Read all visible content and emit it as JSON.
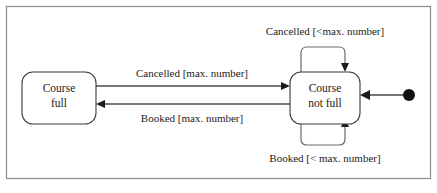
{
  "diagram": {
    "type": "uml-state-machine",
    "frame": {
      "visible": true,
      "color": "#8d8d8d"
    },
    "background": "#ffffff",
    "states": [
      {
        "id": "course-full",
        "label_line1": "Course",
        "label_line2": "full",
        "shape": "rounded-rect"
      },
      {
        "id": "course-not-full",
        "label_line1": "Course",
        "label_line2": "not full",
        "shape": "rounded-rect"
      }
    ],
    "initial_state": {
      "name": "initial-pseudostate",
      "target": "course-not-full",
      "color": "#111111"
    },
    "transitions": [
      {
        "id": "full-to-notfull",
        "from": "course-full",
        "to": "course-not-full",
        "label": "Cancelled [max. number]",
        "position": "upper-middle"
      },
      {
        "id": "notfull-to-full",
        "from": "course-not-full",
        "to": "course-full",
        "label": "Booked [max. number]",
        "position": "lower-middle"
      },
      {
        "id": "notfull-self-cancelled",
        "from": "course-not-full",
        "to": "course-not-full",
        "label": "Cancelled [<max. number]",
        "position": "top-self-loop"
      },
      {
        "id": "notfull-self-booked",
        "from": "course-not-full",
        "to": "course-not-full",
        "label": "Booked [< max. number]",
        "position": "bottom-self-loop"
      }
    ]
  }
}
